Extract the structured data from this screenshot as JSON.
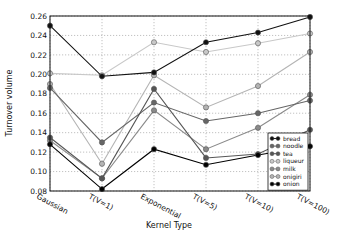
{
  "chart_data": {
    "type": "line",
    "title": "",
    "xlabel": "Kernel Type",
    "ylabel": "Turnover volume",
    "categories": [
      "Gaussian",
      "T(V=1)",
      "Exponential",
      "T(V=5)",
      "T(V=10)",
      "T(V=100)"
    ],
    "ylim": [
      0.08,
      0.26
    ],
    "yticks": [
      "0.08",
      "0.10",
      "0.12",
      "0.14",
      "0.16",
      "0.18",
      "0.20",
      "0.22",
      "0.24",
      "0.26"
    ],
    "grid": true,
    "legend_position": "lower right",
    "series": [
      {
        "name": "bread",
        "color": "#111111",
        "values": [
          0.25,
          0.198,
          0.202,
          0.233,
          0.243,
          0.259
        ]
      },
      {
        "name": "noodle",
        "color": "#666666",
        "values": [
          0.186,
          0.13,
          0.171,
          0.152,
          0.16,
          0.173
        ]
      },
      {
        "name": "tea",
        "color": "#555555",
        "values": [
          0.135,
          0.093,
          0.185,
          0.114,
          0.118,
          0.143
        ]
      },
      {
        "name": "liqueur",
        "color": "#c8c8c8",
        "values": [
          0.201,
          0.199,
          0.233,
          0.223,
          0.232,
          0.242
        ]
      },
      {
        "name": "milk",
        "color": "#8a8a8a",
        "values": [
          0.132,
          0.093,
          0.163,
          0.123,
          0.145,
          0.179
        ]
      },
      {
        "name": "onigiri",
        "color": "#b4b4b4",
        "values": [
          0.19,
          0.108,
          0.199,
          0.166,
          0.188,
          0.223
        ]
      },
      {
        "name": "onion",
        "color": "#000000",
        "values": [
          0.128,
          0.082,
          0.123,
          0.107,
          0.117,
          0.126
        ]
      }
    ]
  }
}
